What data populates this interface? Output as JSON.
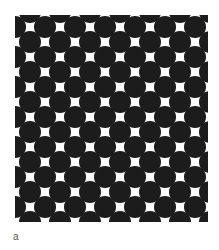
{
  "figure": {
    "panel_label": "a",
    "pattern": {
      "type": "hexagonal-dot-array",
      "dot_color": "#1c1c1c",
      "background_color": "#fdfdfd",
      "dot_diameter_px": 22,
      "horizontal_pitch_px": 30,
      "row_pitch_px": 15,
      "width_px": 193,
      "height_px": 207
    }
  }
}
